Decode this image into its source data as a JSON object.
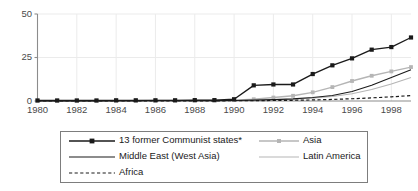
{
  "chart_data": {
    "type": "line",
    "title": "",
    "xlabel": "",
    "ylabel": "",
    "xlim": [
      1980,
      1999
    ],
    "ylim": [
      0,
      50
    ],
    "yticks": [
      0,
      25,
      50
    ],
    "ytick_labels": [
      "0",
      "25",
      "50"
    ],
    "xticks": [
      1980,
      1982,
      1984,
      1986,
      1988,
      1990,
      1992,
      1994,
      1996,
      1998
    ],
    "xtick_labels": [
      "1980",
      "1982",
      "1984",
      "1986",
      "1988",
      "1990",
      "1992",
      "1994",
      "1996",
      "1998"
    ],
    "grid": true,
    "legend_position": "below",
    "x": [
      1980,
      1981,
      1982,
      1983,
      1984,
      1985,
      1986,
      1987,
      1988,
      1989,
      1990,
      1991,
      1992,
      1993,
      1994,
      1995,
      1996,
      1997,
      1998,
      1999
    ],
    "series": [
      {
        "name": "13 former Communist states*",
        "color": "#1a1a1a",
        "style": "solid-markers",
        "values": [
          0.3,
          0.3,
          0.3,
          0.3,
          0.4,
          0.4,
          0.4,
          0.4,
          0.5,
          0.5,
          1.0,
          9.0,
          9.5,
          9.5,
          15.5,
          20.5,
          24.5,
          29.5,
          31.0,
          36.5
        ]
      },
      {
        "name": "Asia",
        "color": "#b5b5b5",
        "style": "solid-markers",
        "values": [
          0.2,
          0.2,
          0.2,
          0.2,
          0.2,
          0.2,
          0.3,
          0.3,
          0.3,
          0.4,
          0.5,
          1.0,
          2.0,
          3.0,
          5.0,
          8.0,
          11.5,
          14.5,
          17.0,
          19.5
        ]
      },
      {
        "name": "Middle East (West Asia)",
        "color": "#1a1a1a",
        "style": "solid-thin",
        "values": [
          0.1,
          0.1,
          0.1,
          0.1,
          0.1,
          0.1,
          0.2,
          0.2,
          0.2,
          0.2,
          0.3,
          0.5,
          0.8,
          1.2,
          2.0,
          3.2,
          5.5,
          9.0,
          13.5,
          18.0
        ]
      },
      {
        "name": "Latin America",
        "color": "#b5b5b5",
        "style": "solid-thin",
        "values": [
          0.1,
          0.1,
          0.1,
          0.1,
          0.1,
          0.1,
          0.1,
          0.1,
          0.2,
          0.2,
          0.2,
          0.4,
          0.7,
          1.0,
          1.6,
          2.6,
          4.2,
          6.6,
          9.8,
          13.5
        ]
      },
      {
        "name": "Africa",
        "color": "#1a1a1a",
        "style": "dashed",
        "values": [
          0.05,
          0.05,
          0.05,
          0.05,
          0.05,
          0.05,
          0.1,
          0.1,
          0.1,
          0.1,
          0.15,
          0.2,
          0.3,
          0.4,
          0.6,
          0.9,
          1.3,
          1.8,
          2.4,
          3.1
        ]
      }
    ]
  },
  "legend": {
    "entries": [
      {
        "label": "13 former Communist states*",
        "style": "solid-markers",
        "color": "#1a1a1a"
      },
      {
        "label": "Middle East (West Asia)",
        "style": "solid-thin",
        "color": "#1a1a1a"
      },
      {
        "label": "Africa",
        "style": "dashed",
        "color": "#1a1a1a"
      },
      {
        "label": "Asia",
        "style": "solid-markers",
        "color": "#b5b5b5"
      },
      {
        "label": "Latin America",
        "style": "solid-thin",
        "color": "#b5b5b5"
      }
    ]
  },
  "colors": {
    "axis": "#8c8c8c",
    "grid": "#ebebeb",
    "tick_text": "#4a4a4a",
    "series_dark": "#1a1a1a",
    "series_light": "#b5b5b5",
    "legend_border": "#7d7d7d",
    "background": "#ffffff"
  }
}
